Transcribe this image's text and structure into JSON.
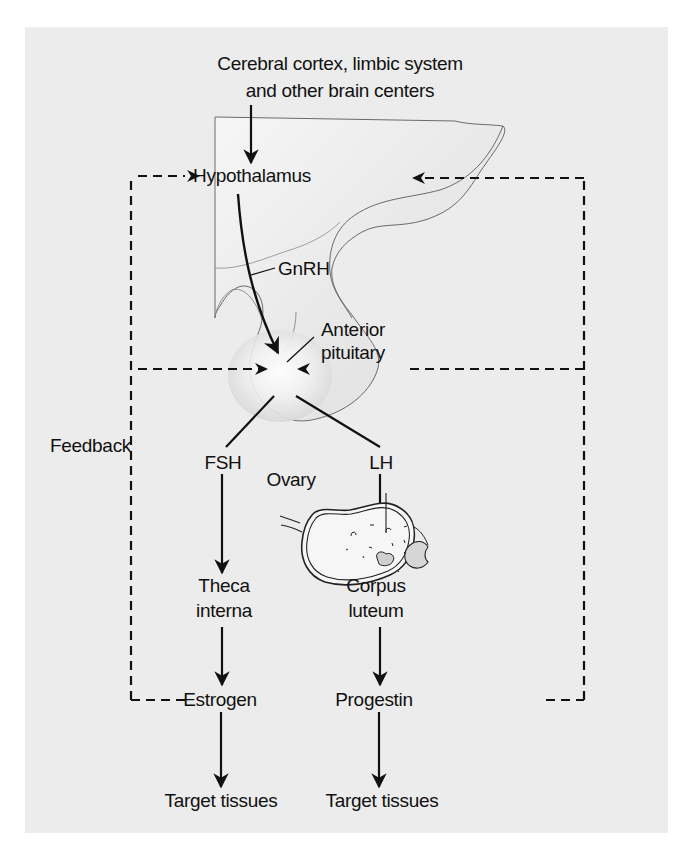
{
  "figure": {
    "source_label": {
      "line1": "Cerebral cortex, limbic system",
      "line2": "and other brain centers"
    },
    "nodes": {
      "hypothalamus": "Hypothalamus",
      "gnrh": "GnRH",
      "anterior_pituitary_line1": "Anterior",
      "anterior_pituitary_line2": "pituitary",
      "fsh": "FSH",
      "lh": "LH",
      "ovary": "Ovary",
      "theca_line1": "Theca",
      "theca_line2": "interna",
      "corpus_line1": "Corpus",
      "corpus_line2": "luteum",
      "estrogen": "Estrogen",
      "progestin": "Progestin",
      "target_left": "Target tissues",
      "target_right": "Target tissues"
    },
    "feedback_label": "Feedback",
    "colors": {
      "panel": "#ececec",
      "ink": "#111111",
      "tissue_fill": "#f4f4f4",
      "tissue_shade": "#d9d9d9",
      "outline": "#6a6a6a"
    }
  }
}
